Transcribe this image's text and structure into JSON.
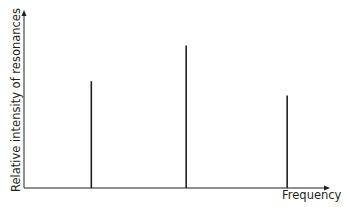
{
  "chart_data": {
    "type": "bar",
    "subtype": "stick-spectrum",
    "title": "",
    "xlabel": "Frequency",
    "ylabel": "Relative intensity of resonances",
    "categories": [
      "peak-1",
      "peak-2",
      "peak-3"
    ],
    "x_positions_relative": [
      0.22,
      0.53,
      0.86
    ],
    "values": [
      0.75,
      1.0,
      0.65
    ],
    "ylim": [
      0,
      1.25
    ],
    "grid": false,
    "legend": null,
    "axis_ticks": false,
    "colors": {
      "axis": "#231f20",
      "peaks": "#231f20"
    }
  }
}
